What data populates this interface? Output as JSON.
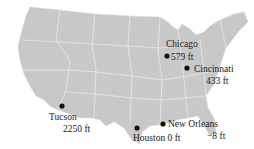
{
  "map": {
    "region": "Contiguous United States",
    "land_color": "#c8c8c8",
    "border_color": "#e6e6e6",
    "marker_color": "#111111"
  },
  "cities": [
    {
      "name": "Chicago",
      "elevation": "579 ft"
    },
    {
      "name": "Cincinnati",
      "elevation": "433 ft"
    },
    {
      "name": "Tucson",
      "elevation": "2250 ft"
    },
    {
      "name": "Houston",
      "elevation": "0 ft",
      "label": "Houston 0 ft"
    },
    {
      "name": "New Orleans",
      "elevation": "−8 ft"
    }
  ]
}
